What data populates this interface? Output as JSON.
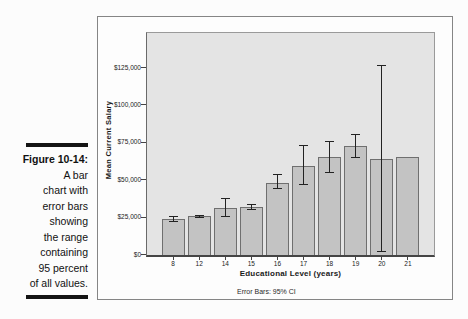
{
  "figure_caption": {
    "label": "Figure 10-14:",
    "lines": [
      "A bar",
      "chart with",
      "error bars",
      "showing",
      "the range",
      "containing",
      "95 percent",
      "of all values."
    ]
  },
  "chart_data": {
    "type": "bar",
    "title": "",
    "xlabel": "Educational Level (years)",
    "ylabel": "Mean Current Salary",
    "footnote": "Error Bars: 95% CI",
    "categories": [
      "8",
      "12",
      "14",
      "15",
      "16",
      "17",
      "18",
      "19",
      "20",
      "21"
    ],
    "values": [
      24000,
      25500,
      31000,
      31500,
      48000,
      59000,
      65000,
      72500,
      64000,
      65000
    ],
    "error_bars_95ci": [
      [
        21500,
        26000
      ],
      [
        24500,
        26500
      ],
      [
        25000,
        37500
      ],
      [
        29500,
        34000
      ],
      [
        43500,
        53500
      ],
      [
        46500,
        73000
      ],
      [
        54500,
        76000
      ],
      [
        64500,
        80500
      ],
      [
        2000,
        127000
      ],
      null
    ],
    "y_ticks": [
      {
        "label": "$0",
        "value": 0
      },
      {
        "label": "$25,000",
        "value": 25000
      },
      {
        "label": "$50,000",
        "value": 50000
      },
      {
        "label": "$75,000",
        "value": 75000
      },
      {
        "label": "$100,000",
        "value": 100000
      },
      {
        "label": "$125,000",
        "value": 125000
      }
    ],
    "ylim": [
      0,
      150000
    ],
    "grid": false,
    "legend_position": null,
    "colors": {
      "bar_fill": "#c3c3c3",
      "bar_border": "#6f6f6f",
      "plot_bg": "#e4e4e4",
      "error_bar": "#222222",
      "frame_border": "#858585"
    }
  }
}
